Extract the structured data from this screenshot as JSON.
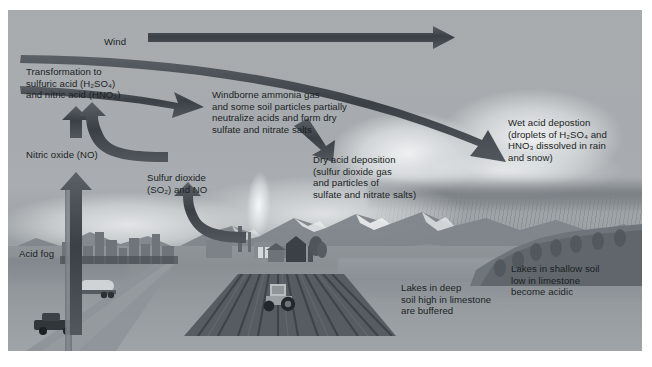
{
  "figure": {
    "background_color": "#a9adb0",
    "arrow_color": "#3f464c",
    "text_color": "#1b1f23",
    "border_color": "#ffffff"
  },
  "labels": {
    "wind": "Wind",
    "transformation": "Transformation to\nsulfuric acid (H₂SO₄)\nand nitric acid (HNO₃)",
    "nitric_oxide": "Nitric oxide (NO)",
    "acid_fog": "Acid fog",
    "sulfur_dioxide": "Sulfur dioxide\n(SO₂) and NO",
    "windborne": "Windborne ammonia gas\nand some soil particles partially\nneutralize acids and form dry\nsulfate and nitrate salts",
    "dry_deposition": "Dry acid deposition\n(sulfur dioxide gas\nand particles of\nsulfate and nitrate salts)",
    "wet_deposition": "Wet acid depostion\n(droplets of H₂SO₄ and\nHNO₃ dissolved in rain\nand snow)",
    "lakes_deep": "Lakes in deep\nsoil high in limestone\nare buffered",
    "lakes_shallow": "Lakes in shallow soil\nlow in limestone\nbecome acidic"
  },
  "arrows": [
    {
      "name": "wind-arrow",
      "direction": "right",
      "description": "Straight horizontal arrow pointing right labelled Wind"
    },
    {
      "name": "upper-transport-arrow",
      "direction": "right-down",
      "description": "Long tapering arrow curving right and down toward the rain cloud"
    },
    {
      "name": "windborne-arrow",
      "direction": "right",
      "description": "Short tapering arrow pointing right into the windborne ammonia text"
    },
    {
      "name": "wet-deposition-arrow",
      "direction": "down-right",
      "description": "Sweeping arrow curving down-right to the wet acid deposition label"
    },
    {
      "name": "dry-deposition-arrow",
      "direction": "down-right",
      "description": "Short arrow pointing down-right to the dry acid deposition label"
    },
    {
      "name": "nitric-oxide-upper-arrow",
      "direction": "up",
      "description": "Short vertical arrow above the Nitric oxide label"
    },
    {
      "name": "nitric-oxide-lower-arrow",
      "direction": "up",
      "description": "Tall vertical arrow rising from the roadway to the Nitric oxide label"
    },
    {
      "name": "transformation-curve-arrow",
      "direction": "left-up",
      "description": "Curved arrow sweeping left and up into the transformation label"
    },
    {
      "name": "sulfur-dioxide-arrow",
      "direction": "left-up",
      "description": "Curved arrow from the plant rising up and left to the Sulfur dioxide label"
    }
  ],
  "scene": {
    "elements": [
      {
        "name": "sky",
        "label": "Overcast grey sky"
      },
      {
        "name": "cloud",
        "label": "Cumulus cloud bank"
      },
      {
        "name": "rain",
        "label": "Rain falling from cloud"
      },
      {
        "name": "mountains",
        "label": "Snow-capped mountain range"
      },
      {
        "name": "lake",
        "label": "Lake in the valley"
      },
      {
        "name": "forest",
        "label": "Forested headland"
      },
      {
        "name": "city",
        "label": "City skyline"
      },
      {
        "name": "smokestack",
        "label": "Industrial plant with smokestack plume"
      },
      {
        "name": "farm-field",
        "label": "Plowed farm field with tractor"
      },
      {
        "name": "barn",
        "label": "Farm buildings"
      },
      {
        "name": "road",
        "label": "Highway with tanker truck and pickup truck"
      }
    ]
  }
}
